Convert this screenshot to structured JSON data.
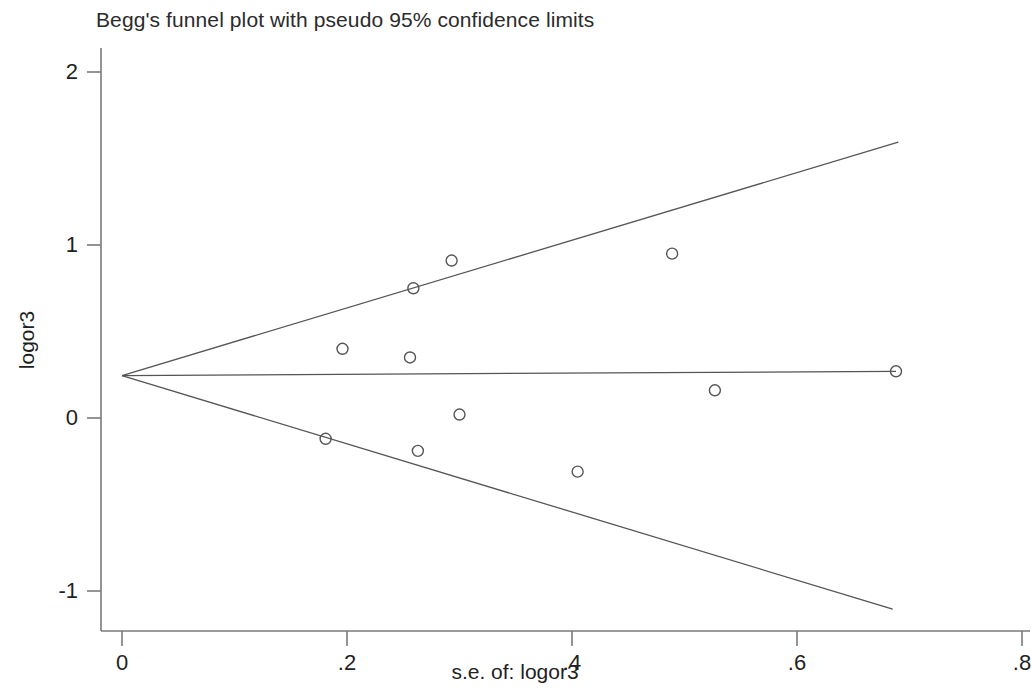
{
  "chart_data": {
    "type": "scatter",
    "title": "Begg's funnel plot with pseudo 95% confidence limits",
    "xlabel": "s.e. of: logor3",
    "ylabel": "logor3",
    "xlim": [
      0,
      0.8
    ],
    "ylim": [
      -1.25,
      2.15
    ],
    "grid": false,
    "legend": null,
    "xticks": [
      {
        "value": 0,
        "label": "0"
      },
      {
        "value": 0.2,
        "label": ".2"
      },
      {
        "value": 0.4,
        "label": ".4"
      },
      {
        "value": 0.6,
        "label": ".6"
      },
      {
        "value": 0.8,
        "label": ".8"
      }
    ],
    "yticks": [
      {
        "value": 2,
        "label": "2"
      },
      {
        "value": 1,
        "label": "1"
      },
      {
        "value": 0,
        "label": "0"
      },
      {
        "value": -1,
        "label": "-1"
      }
    ],
    "series": [
      {
        "name": "studies",
        "marker": "open-circle",
        "color": "#555555",
        "points": [
          {
            "x": 0.181,
            "y": -0.12
          },
          {
            "x": 0.196,
            "y": 0.4
          },
          {
            "x": 0.256,
            "y": 0.35
          },
          {
            "x": 0.259,
            "y": 0.75
          },
          {
            "x": 0.263,
            "y": -0.19
          },
          {
            "x": 0.293,
            "y": 0.91
          },
          {
            "x": 0.3,
            "y": 0.02
          },
          {
            "x": 0.405,
            "y": -0.31
          },
          {
            "x": 0.489,
            "y": 0.95
          },
          {
            "x": 0.527,
            "y": 0.16
          },
          {
            "x": 0.688,
            "y": 0.27
          }
        ]
      }
    ],
    "reference_lines": [
      {
        "name": "pooled-effect-line",
        "color": "#555555",
        "from": {
          "x": 0.0,
          "y": 0.245
        },
        "to": {
          "x": 0.688,
          "y": 0.27
        }
      },
      {
        "name": "upper-95-confidence-limit",
        "color": "#555555",
        "from": {
          "x": 0.0,
          "y": 0.245
        },
        "to": {
          "x": 0.69,
          "y": 1.595
        }
      },
      {
        "name": "lower-95-confidence-limit",
        "color": "#555555",
        "from": {
          "x": 0.0,
          "y": 0.245
        },
        "to": {
          "x": 0.685,
          "y": -1.105
        }
      }
    ],
    "pooled_effect": 0.245
  }
}
